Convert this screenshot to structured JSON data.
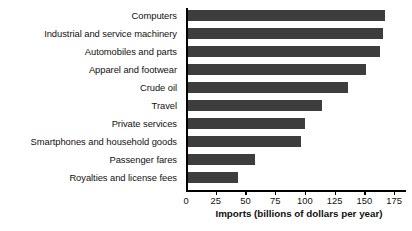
{
  "chart_data": {
    "type": "bar",
    "orientation": "horizontal",
    "title": "",
    "xlabel": "Imports (billions of dollars per year)",
    "ylabel": "",
    "categories": [
      "Computers",
      "Industrial and service machinery",
      "Automobiles and parts",
      "Apparel and footwear",
      "Crude oil",
      "Travel",
      "Private services",
      "Smartphones and household goods",
      "Passenger fares",
      "Royalties and license fees"
    ],
    "values": [
      167,
      166,
      163,
      151,
      136,
      114,
      100,
      97,
      58,
      44
    ],
    "xlim": [
      0,
      185
    ],
    "xticks": [
      0,
      25,
      50,
      75,
      100,
      125,
      150,
      175
    ],
    "xtick_labels": [
      "0",
      "25",
      "50",
      "75",
      "100",
      "125",
      "150",
      "175"
    ],
    "grid": false,
    "legend": false,
    "bar_color": "#3d3d3d",
    "axis_color": "#000000"
  }
}
